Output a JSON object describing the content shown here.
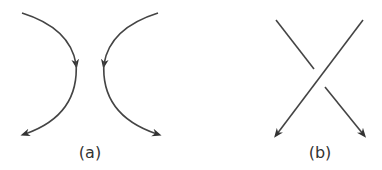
{
  "diagrams": [
    {
      "id": "a",
      "label": "(a)",
      "description": "Two arcs curving apart, oriented downward with arrowheads (smoothing)"
    },
    {
      "id": "b",
      "label": "(b)",
      "description": "Crossing of two strands with arrowheads pointing down (over/under crossing)"
    }
  ],
  "colors": {
    "stroke": "#444444",
    "text": "#333333",
    "background": "#ffffff"
  }
}
